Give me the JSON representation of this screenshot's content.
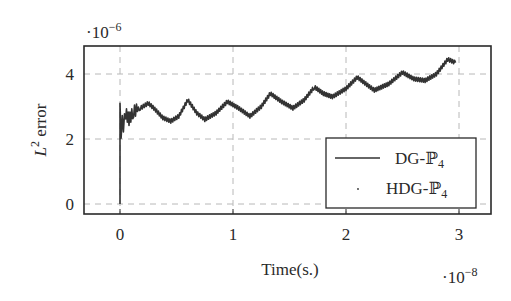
{
  "chart_data": {
    "type": "line",
    "title": "",
    "xlabel": "Time(s.)",
    "ylabel": "L² error",
    "ylabel_base": "L",
    "ylabel_sup": "2",
    "ylabel_rest": " error",
    "x_multiplier": "·10",
    "x_multiplier_exp": "−8",
    "y_multiplier": "·10",
    "y_multiplier_exp": "−6",
    "xlim": [
      -0.3,
      3.3
    ],
    "ylim": [
      -0.35,
      4.75
    ],
    "xticks": [
      0,
      1,
      2,
      3
    ],
    "yticks": [
      0,
      2,
      4
    ],
    "xtick_labels": [
      "0",
      "1",
      "2",
      "3"
    ],
    "ytick_labels": [
      "0",
      "2",
      "4"
    ],
    "grid": true,
    "legend_position": "lower right",
    "legend": [
      {
        "name": "DG-ℙ",
        "sub": "4",
        "style": "solid line"
      },
      {
        "name": "HDG-ℙ",
        "sub": "4",
        "style": "dot marker"
      }
    ],
    "series": [
      {
        "name": "DG-P4",
        "x": [
          0.0,
          0.0,
          0.01,
          0.02,
          0.03,
          0.05,
          0.08,
          0.12,
          0.18,
          0.25,
          0.3,
          0.38,
          0.45,
          0.52,
          0.6,
          0.68,
          0.75,
          0.85,
          0.95,
          1.05,
          1.15,
          1.25,
          1.33,
          1.43,
          1.53,
          1.63,
          1.72,
          1.8,
          1.88,
          2.0,
          2.1,
          2.25,
          2.38,
          2.5,
          2.6,
          2.7,
          2.8,
          2.9,
          2.97
        ],
        "values": [
          0.0,
          3.1,
          2.2,
          2.9,
          2.4,
          2.8,
          2.6,
          2.85,
          2.95,
          3.1,
          2.95,
          2.65,
          2.55,
          2.7,
          3.2,
          2.8,
          2.6,
          2.8,
          3.15,
          2.95,
          2.7,
          3.0,
          3.4,
          3.15,
          2.95,
          3.2,
          3.6,
          3.4,
          3.3,
          3.55,
          3.9,
          3.5,
          3.7,
          4.05,
          3.85,
          3.8,
          4.0,
          4.45,
          4.35
        ]
      },
      {
        "name": "HDG-P4",
        "x": [],
        "values": []
      }
    ]
  },
  "colors": {
    "line": "#333333",
    "axis": "#2a2a2a",
    "grid": "#b8b8b8"
  }
}
